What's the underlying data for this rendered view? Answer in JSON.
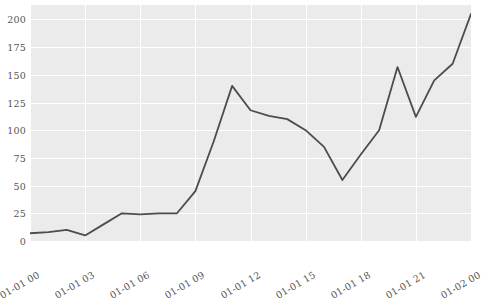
{
  "chart_data": {
    "type": "line",
    "title": "",
    "xlabel": "",
    "ylabel": "",
    "x": [
      "01-01 00",
      "01-01 01",
      "01-01 02",
      "01-01 03",
      "01-01 04",
      "01-01 05",
      "01-01 06",
      "01-01 07",
      "01-01 08",
      "01-01 09",
      "01-01 10",
      "01-01 11",
      "01-01 12",
      "01-01 13",
      "01-01 14",
      "01-01 15",
      "01-01 16",
      "01-01 17",
      "01-01 18",
      "01-01 19",
      "01-01 20",
      "01-01 21",
      "01-01 22",
      "01-01 23",
      "01-02 00"
    ],
    "values": [
      7,
      8,
      10,
      5,
      15,
      25,
      24,
      25,
      25,
      45,
      90,
      140,
      118,
      113,
      110,
      100,
      85,
      55,
      78,
      100,
      157,
      112,
      145,
      160,
      205
    ],
    "series": [
      {
        "name": "value",
        "color": "#4c4c4c",
        "values": [
          7,
          8,
          10,
          5,
          15,
          25,
          24,
          25,
          25,
          45,
          90,
          140,
          118,
          113,
          110,
          100,
          85,
          55,
          78,
          100,
          157,
          112,
          145,
          160,
          205
        ]
      }
    ],
    "xlim": [
      0,
      24
    ],
    "ylim": [
      0,
      213
    ],
    "yticks": [
      0,
      25,
      50,
      75,
      100,
      125,
      150,
      175,
      200
    ],
    "ytick_labels": [
      "0",
      "25",
      "50",
      "75",
      "100",
      "125",
      "150",
      "175",
      "200"
    ],
    "xticks": [
      0,
      3,
      6,
      9,
      12,
      15,
      18,
      21,
      24
    ],
    "xtick_labels": [
      "01-01 00",
      "01-01 03",
      "01-01 06",
      "01-01 09",
      "01-01 12",
      "01-01 15",
      "01-01 18",
      "01-01 21",
      "01-02 00"
    ],
    "xtick_rotation": -30,
    "grid": true,
    "grid_color": "#ffffff",
    "plot_background": "#ebebeb",
    "figure_background": "#ffffff",
    "legend": null,
    "legend_position": "none",
    "line_width": 1.8,
    "markers": false
  }
}
